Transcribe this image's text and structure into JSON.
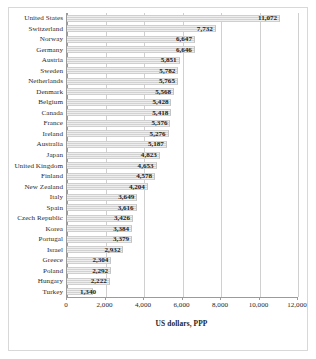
{
  "chart_data": {
    "type": "bar",
    "orientation": "horizontal",
    "title": "",
    "xlabel": "US dollars, PPP",
    "ylabel": "",
    "xlim": [
      0,
      12000
    ],
    "xticks": [
      0,
      2000,
      4000,
      6000,
      8000,
      10000,
      12000
    ],
    "xtick_labels": [
      "0",
      "2,000",
      "4,000",
      "6,000",
      "8,000",
      "10,000",
      "12,000"
    ],
    "grid": "vertical",
    "legend": "none",
    "categories": [
      "United States",
      "Switzerland",
      "Norway",
      "Germany",
      "Austria",
      "Sweden",
      "Netherlands",
      "Denmark",
      "Belgium",
      "Canada",
      "France",
      "Ireland",
      "Australia",
      "Japan",
      "United Kingdom",
      "Finland",
      "New Zealand",
      "Italy",
      "Spain",
      "Czech Republic",
      "Korea",
      "Portugal",
      "Israel",
      "Greece",
      "Poland",
      "Hungary",
      "Turkey"
    ],
    "values": [
      11072,
      7732,
      6647,
      6646,
      5851,
      5782,
      5765,
      5568,
      5428,
      5418,
      5376,
      5276,
      5187,
      4823,
      4653,
      4578,
      4204,
      3649,
      3616,
      3426,
      3384,
      3379,
      2932,
      2304,
      2292,
      2222,
      1340
    ],
    "value_labels": [
      "11,072",
      "7,732",
      "6,647",
      "6,646",
      "5,851",
      "5,782",
      "5,765",
      "5,568",
      "5,428",
      "5,418",
      "5,376",
      "5,276",
      "5,187",
      "4,823",
      "4,653",
      "4,578",
      "4,204",
      "3,649",
      "3,616",
      "3,426",
      "3,384",
      "3,379",
      "2,932",
      "2,304",
      "2,292",
      "2,222",
      "1,340"
    ],
    "colors": {
      "bar_fill": "#e3e3e3",
      "bar_stripe": "#d2d2d2",
      "axis": "#9b9b9b",
      "gridline": "#d0d0d0",
      "text": "#1d1d1d",
      "frame": "#d8d8d8",
      "background": "#ffffff"
    }
  }
}
